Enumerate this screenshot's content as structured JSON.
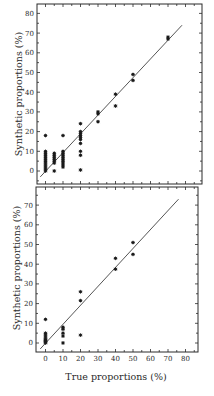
{
  "chart_data": [
    {
      "type": "scatter",
      "panel": "top",
      "title": "",
      "xlabel": "",
      "ylabel": "Synthetic proportions (%)",
      "xlim": [
        -5,
        90
      ],
      "ylim": [
        -6.5,
        85
      ],
      "yticks": [
        0,
        10,
        20,
        30,
        40,
        50,
        60,
        70,
        80
      ],
      "xticks_labeled": false,
      "grid": false,
      "marker": "asterisk",
      "reference_line": {
        "x": [
          -3,
          78
        ],
        "y": [
          -3,
          74
        ],
        "label": "1:1 line"
      },
      "points": [
        {
          "x": 0,
          "y": 18
        },
        {
          "x": 0,
          "y": 10
        },
        {
          "x": 0,
          "y": 9
        },
        {
          "x": 0,
          "y": 8
        },
        {
          "x": 0,
          "y": 7
        },
        {
          "x": 0,
          "y": 6
        },
        {
          "x": 0,
          "y": 5
        },
        {
          "x": 0,
          "y": 4
        },
        {
          "x": 0,
          "y": 3
        },
        {
          "x": 0,
          "y": 2
        },
        {
          "x": 0,
          "y": 1
        },
        {
          "x": 0,
          "y": 0
        },
        {
          "x": 5,
          "y": 9
        },
        {
          "x": 5,
          "y": 8
        },
        {
          "x": 5,
          "y": 7
        },
        {
          "x": 5,
          "y": 6
        },
        {
          "x": 5,
          "y": 5
        },
        {
          "x": 5,
          "y": 4
        },
        {
          "x": 5,
          "y": 0
        },
        {
          "x": 10,
          "y": 18
        },
        {
          "x": 10,
          "y": 10
        },
        {
          "x": 10,
          "y": 9
        },
        {
          "x": 10,
          "y": 8
        },
        {
          "x": 10,
          "y": 7
        },
        {
          "x": 10,
          "y": 6
        },
        {
          "x": 10,
          "y": 5
        },
        {
          "x": 10,
          "y": 4
        },
        {
          "x": 10,
          "y": 3
        },
        {
          "x": 10,
          "y": 2
        },
        {
          "x": 20,
          "y": 24
        },
        {
          "x": 20,
          "y": 20
        },
        {
          "x": 20,
          "y": 19
        },
        {
          "x": 20,
          "y": 18
        },
        {
          "x": 20,
          "y": 17
        },
        {
          "x": 20,
          "y": 16
        },
        {
          "x": 20,
          "y": 14
        },
        {
          "x": 20,
          "y": 10
        },
        {
          "x": 20,
          "y": 8
        },
        {
          "x": 20,
          "y": 0.5
        },
        {
          "x": 30,
          "y": 30
        },
        {
          "x": 30,
          "y": 29
        },
        {
          "x": 30,
          "y": 25
        },
        {
          "x": 40,
          "y": 39
        },
        {
          "x": 40,
          "y": 33
        },
        {
          "x": 50,
          "y": 49
        },
        {
          "x": 50,
          "y": 46
        },
        {
          "x": 70,
          "y": 68
        },
        {
          "x": 70,
          "y": 67
        }
      ]
    },
    {
      "type": "scatter",
      "panel": "bottom",
      "title": "",
      "xlabel": "True proportions (%)",
      "ylabel": "Synthetic proportions (%)",
      "xlim": [
        -5,
        88
      ],
      "ylim": [
        -5,
        79
      ],
      "xticks": [
        0,
        10,
        20,
        30,
        40,
        50,
        60,
        70,
        80
      ],
      "yticks": [
        0,
        10,
        20,
        30,
        40,
        50,
        60,
        70
      ],
      "grid": false,
      "marker": "asterisk",
      "reference_line": {
        "x": [
          -3,
          76
        ],
        "y": [
          -3,
          73
        ],
        "label": "1:1 line"
      },
      "points": [
        {
          "x": 0,
          "y": 12
        },
        {
          "x": 0,
          "y": 5
        },
        {
          "x": 0,
          "y": 4
        },
        {
          "x": 0,
          "y": 3
        },
        {
          "x": 0,
          "y": 2
        },
        {
          "x": 0,
          "y": 1.5
        },
        {
          "x": 0,
          "y": 1
        },
        {
          "x": 0,
          "y": 0.5
        },
        {
          "x": 0,
          "y": 0
        },
        {
          "x": 10,
          "y": 8
        },
        {
          "x": 10,
          "y": 7
        },
        {
          "x": 10,
          "y": 5
        },
        {
          "x": 10,
          "y": 3.5
        },
        {
          "x": 10,
          "y": 0
        },
        {
          "x": 20,
          "y": 26
        },
        {
          "x": 20,
          "y": 21.5
        },
        {
          "x": 20,
          "y": 4
        },
        {
          "x": 40,
          "y": 43
        },
        {
          "x": 40,
          "y": 37.5
        },
        {
          "x": 50,
          "y": 51
        },
        {
          "x": 50,
          "y": 45
        }
      ]
    }
  ],
  "labels": {
    "top_ylabel": "Synthetic proportions (%)",
    "bottom_ylabel": "Synthetic proportions (%)",
    "bottom_xlabel": "True proportions (%)"
  },
  "colors": {
    "ink": "#2a2a2a",
    "marker": "#1a1a1a",
    "background": "#ffffff"
  }
}
